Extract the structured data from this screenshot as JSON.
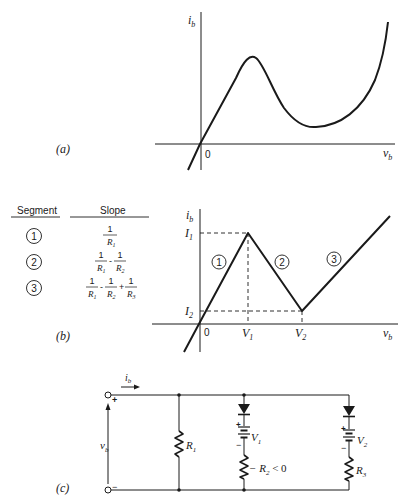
{
  "figure": {
    "panel_a": {
      "label": "(a)",
      "y_axis_label": "i",
      "y_axis_sub": "b",
      "x_axis_label": "v",
      "x_axis_sub": "b",
      "origin_label": "0",
      "description": "N-shaped (negative-resistance) i-v characteristic"
    },
    "panel_b": {
      "label": "(b)",
      "table": {
        "headers": [
          "Segment",
          "Slope"
        ],
        "rows": [
          {
            "segment": "1",
            "slope": "1/R1"
          },
          {
            "segment": "2",
            "slope": "1/R1 - 1/R2"
          },
          {
            "segment": "3",
            "slope": "1/R1 - 1/R2 + 1/R3"
          }
        ]
      },
      "y_axis_label": "i",
      "y_axis_sub": "b",
      "x_axis_label": "v",
      "x_axis_sub": "b",
      "origin_label": "0",
      "y_ticks": [
        {
          "main": "I",
          "sub": "1"
        },
        {
          "main": "I",
          "sub": "2"
        }
      ],
      "x_ticks": [
        {
          "main": "V",
          "sub": "1"
        },
        {
          "main": "V",
          "sub": "2"
        }
      ],
      "segment_markers": [
        "1",
        "2",
        "3"
      ],
      "description": "Piecewise-linear approximation with three segments"
    },
    "panel_c": {
      "label": "(c)",
      "current_label": "i",
      "current_sub": "b",
      "voltage_label": "v",
      "voltage_sub": "b",
      "plus": "+",
      "minus": "−",
      "R1": {
        "main": "R",
        "sub": "1"
      },
      "V1": {
        "main": "V",
        "sub": "1"
      },
      "R2": {
        "prefix": "− R",
        "sub": "2",
        "suffix": " < 0"
      },
      "V2": {
        "main": "V",
        "sub": "2"
      },
      "R3": {
        "main": "R",
        "sub": "3"
      }
    }
  }
}
